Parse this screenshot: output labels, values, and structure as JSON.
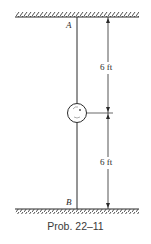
{
  "figure": {
    "caption": "Prob. 22–11",
    "support_top_label": "A",
    "support_bottom_label": "B",
    "dimensions": [
      {
        "label": "6 ft",
        "from": "A",
        "to": "mass"
      },
      {
        "label": "6 ft",
        "from": "mass",
        "to": "B"
      }
    ],
    "mass_icon": "disk-mass-icon",
    "colors": {
      "line": "#2a2a2a",
      "background": "#ffffff"
    }
  }
}
